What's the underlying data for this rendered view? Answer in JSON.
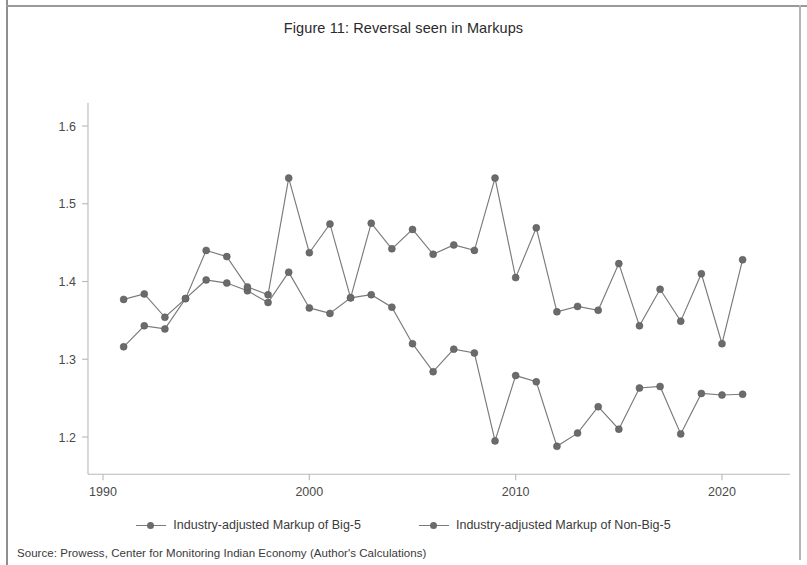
{
  "figure": {
    "title": "Figure 11: Reversal seen in Markups",
    "source_note": "Source: Prowess, Center for Monitoring Indian Economy (Author's Calculations)"
  },
  "legend": {
    "items": [
      {
        "label": "Industry-adjusted Markup of Big-5",
        "color": "#6b6b6b"
      },
      {
        "label": "Industry-adjusted Markup of Non-Big-5",
        "color": "#6b6b6b"
      }
    ]
  },
  "chart_data": {
    "type": "line",
    "title": "Figure 11: Reversal seen in Markups",
    "xlabel": "year",
    "ylabel": "",
    "xlim": [
      1990.0,
      1.0
    ],
    "ylim": [
      1.15,
      1.63
    ],
    "xticks": [
      "1990",
      "2000",
      "2010",
      "2020"
    ],
    "xtick_values": [
      1990,
      2000,
      2010,
      2020
    ],
    "yticks": [
      "1.2",
      "1.3",
      "1.4",
      "1.5",
      "1.6"
    ],
    "ytick_values": [
      1.2,
      1.3,
      1.4,
      1.5,
      1.6
    ],
    "grid": false,
    "legend_position": "bottom",
    "x": [
      1991,
      1992,
      1993,
      1994,
      1995,
      1996,
      1997,
      1998,
      1999,
      2000,
      2001,
      2002,
      2003,
      2004,
      2005,
      2006,
      2007,
      2008,
      2009,
      2010,
      2011,
      2012,
      2013,
      2014,
      2015,
      2016,
      2017,
      2018,
      2019,
      2020,
      2021
    ],
    "series": [
      {
        "name": "Industry-adjusted Markup of Big-5",
        "color": "#6b6b6b",
        "values": [
          1.316,
          1.343,
          1.339,
          1.378,
          1.402,
          1.398,
          1.388,
          1.373,
          1.412,
          1.366,
          1.359,
          1.379,
          1.383,
          1.367,
          1.32,
          1.284,
          1.313,
          1.308,
          1.195,
          1.279,
          1.271,
          1.188,
          1.205,
          1.239,
          1.21,
          1.263,
          1.265,
          1.204,
          1.256,
          1.254,
          1.255
        ]
      },
      {
        "name": "Industry-adjusted Markup of Non-Big-5",
        "color": "#6b6b6b",
        "values": [
          1.377,
          1.384,
          1.354,
          1.378,
          1.44,
          1.432,
          1.393,
          1.383,
          1.533,
          1.437,
          1.474,
          1.379,
          1.475,
          1.442,
          1.467,
          1.435,
          1.447,
          1.44,
          1.533,
          1.405,
          1.469,
          1.361,
          1.368,
          1.363,
          1.423,
          1.343,
          1.39,
          1.349,
          1.41,
          1.32,
          1.428
        ]
      }
    ]
  }
}
